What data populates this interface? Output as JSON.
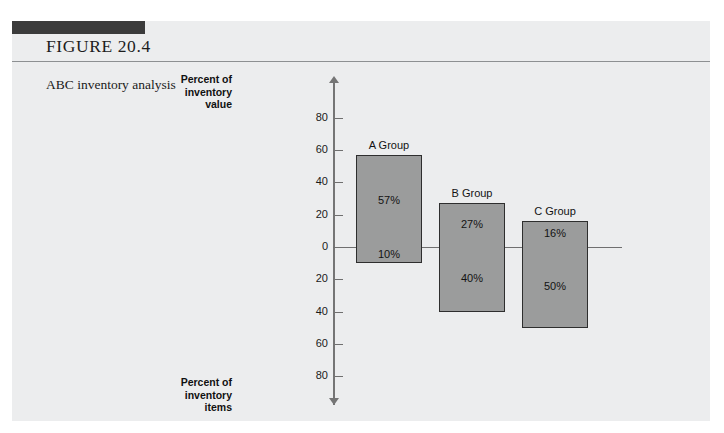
{
  "figure": {
    "number_label": "FIGURE 20.4",
    "caption": "ABC inventory analysis"
  },
  "chart_data": {
    "type": "bar",
    "title": "ABC inventory analysis",
    "orientation": "vertical-diverging",
    "categories": [
      "A Group",
      "B Group",
      "C Group"
    ],
    "series": [
      {
        "name": "Percent of inventory value",
        "axis": "top",
        "values": [
          57,
          27,
          16
        ],
        "labels": [
          "57%",
          "27%",
          "16%"
        ]
      },
      {
        "name": "Percent of inventory items",
        "axis": "bottom",
        "values": [
          10,
          40,
          50
        ],
        "labels": [
          "10%",
          "40%",
          "50%"
        ]
      }
    ],
    "axis_top_label": "Percent of inventory value",
    "axis_bottom_label": "Percent of inventory items",
    "axis_top_label_lines": [
      "Percent of",
      "inventory",
      "value"
    ],
    "axis_bottom_label_lines": [
      "Percent of",
      "inventory",
      "items"
    ],
    "ticks_upper": [
      80,
      60,
      40,
      20,
      0
    ],
    "ticks_lower": [
      20,
      40,
      60,
      80
    ],
    "tick_labels": [
      "80",
      "60",
      "40",
      "20",
      "0",
      "20",
      "40",
      "60",
      "80"
    ],
    "ylim": [
      -100,
      100
    ],
    "grid": false,
    "legend": "none",
    "xlabel": "",
    "ylabel": ""
  },
  "colors": {
    "panel_background": "#ecedee",
    "tab_bar": "#3b3b3b",
    "bar_fill": "#9b9c9c",
    "bar_stroke": "#2e2e2e",
    "axis": "#757575",
    "rule": "#8d9092"
  }
}
